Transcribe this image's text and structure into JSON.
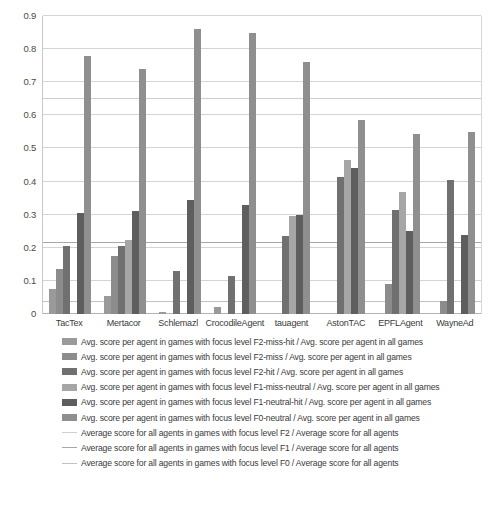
{
  "chart_data": {
    "type": "bar",
    "title": "",
    "subtitle": "",
    "xlabel": "",
    "ylabel": "",
    "ylim": [
      0,
      0.9
    ],
    "ytick_labels": [
      "0.9",
      "0.8",
      "0.7",
      "0.6",
      "0.5",
      "0.4",
      "0.3",
      "0.2",
      "0.1",
      "0"
    ],
    "ytick_values": [
      0.9,
      0.8,
      0.7,
      0.6,
      0.5,
      0.4,
      0.3,
      0.2,
      0.1,
      0
    ],
    "grid": true,
    "legend_position": "bottom",
    "bar_mode": "clustered",
    "categories": [
      "TacTex",
      "Mertacor",
      "Schlemazl",
      "CrocodileAgent",
      "tauagent",
      "AstonTAC",
      "EPFLAgent",
      "WayneAd"
    ],
    "series": [
      {
        "name": "Avg. score per agent in games with focus level F2-miss-hit / Avg. score per agent in all games",
        "short_name": "F2-miss-hit",
        "color": "#9a9a9a",
        "values": [
          0.075,
          0.055,
          0.005,
          0.02,
          0.0,
          0.0,
          0.0,
          0.0
        ]
      },
      {
        "name": "Avg. score per agent in games with focus level F2-miss / Avg. score per agent in all games",
        "short_name": "F2-miss",
        "color": "#8c8c8c",
        "values": [
          0.135,
          0.175,
          0.0,
          0.0,
          0.0,
          0.0,
          0.09,
          0.04
        ]
      },
      {
        "name": "Avg. score per agent in games with focus level F2-hit / Avg. score per agent in all games",
        "short_name": "F2-hit",
        "color": "#707070",
        "values": [
          0.205,
          0.205,
          0.13,
          0.115,
          0.235,
          0.415,
          0.315,
          0.405
        ]
      },
      {
        "name": "Avg. score per agent in games with focus level F1-miss-neutral / Avg. score per agent in all games",
        "short_name": "F1-miss-neutral",
        "color": "#a6a6a6",
        "values": [
          0.0,
          0.225,
          0.0,
          0.0,
          0.295,
          0.465,
          0.37,
          0.0
        ]
      },
      {
        "name": "Avg. score per agent in games with focus level F1-neutral-hit / Avg. score per agent in all games",
        "short_name": "F1-neutral-hit",
        "color": "#5e5e5e",
        "values": [
          0.305,
          0.31,
          0.345,
          0.33,
          0.3,
          0.44,
          0.25,
          0.24
        ]
      },
      {
        "name": "Avg. score per agent in games with focus level F0-neutral / Avg. score per agent in all games",
        "short_name": "F0-neutral",
        "color": "#8f8f8f",
        "values": [
          0.78,
          0.74,
          0.86,
          0.85,
          0.76,
          0.585,
          0.545,
          0.55
        ]
      }
    ],
    "reference_lines": [
      {
        "name": "Average score for all agents in games with focus level F2 / Average score for all agents",
        "short_name": "F2",
        "value": 0.65,
        "color": "#cfcfcf"
      },
      {
        "name": "Average score for all agents in games with focus level F1 / Average score for all agents",
        "short_name": "F1",
        "value": 0.215,
        "color": "#a8a8a8"
      },
      {
        "name": "Average score for all agents in games with focus level F0 / Average score for all agents",
        "short_name": "F0",
        "value": 0.035,
        "color": "#c2c2c2"
      }
    ]
  },
  "legend": {
    "bar_entries": [
      "Avg. score per agent in games with focus level F2-miss-hit / Avg. score per agent in all games",
      "Avg. score per agent in games with focus level F2-miss / Avg. score per agent in all games",
      "Avg. score per agent in games with focus level F2-hit / Avg. score per agent in all games",
      "Avg. score per agent in games with focus level F1-miss-neutral / Avg. score per agent in all games",
      "Avg. score per agent in games with focus level F1-neutral-hit / Avg. score per agent in all games",
      "Avg. score per agent in games with focus level F0-neutral / Avg. score per agent in all games"
    ],
    "line_entries": [
      "Average score for all agents in games with focus level F2 / Average score for all agents",
      "Average score for all agents in games with focus level F1 / Average score for all agents",
      "Average score for all agents in games with focus level F0 / Average score for all agents"
    ]
  }
}
